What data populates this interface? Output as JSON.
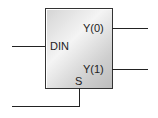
{
  "block": {
    "name": "demux-block",
    "ports": {
      "input": "DIN",
      "select": "S",
      "outputs": [
        "Y(0)",
        "Y(1)"
      ]
    }
  }
}
